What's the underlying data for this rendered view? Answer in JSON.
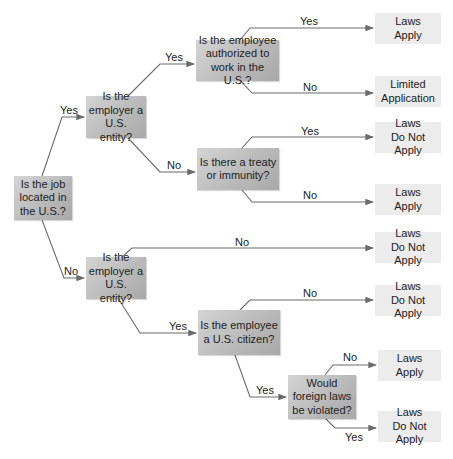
{
  "diagram": {
    "questions": {
      "q_job_location": "Is the job located in the U.S.?",
      "q_employer_top": "Is the employer a U.S. entity?",
      "q_authorized": "Is the employee authorized to work in the U.S.?",
      "q_treaty": "Is there a treaty or immunity?",
      "q_employer_bottom": "Is the employer a U.S. entity?",
      "q_citizen": "Is the employee a U.S. citizen?",
      "q_foreign_laws": "Would foreign laws be violated?"
    },
    "outcomes": {
      "o1": "Laws Apply",
      "o2": "Limited Application",
      "o3": "Laws Do Not Apply",
      "o4": "Laws Apply",
      "o5": "Laws Do Not Apply",
      "o6": "Laws Do Not Apply",
      "o7": "Laws Apply",
      "o8": "Laws Do Not Apply"
    },
    "edges": {
      "e_job_yes": "Yes",
      "e_job_no": "No",
      "e_emp_top_yes": "Yes",
      "e_emp_top_no": "No",
      "e_auth_yes": "Yes",
      "e_auth_no": "No",
      "e_treaty_yes": "Yes",
      "e_treaty_no": "No",
      "e_emp_bottom_no": "No",
      "e_emp_bottom_yes": "Yes",
      "e_citizen_no": "No",
      "e_citizen_yes": "Yes",
      "e_foreign_no": "No",
      "e_foreign_yes": "Yes"
    },
    "colors": {
      "line": "#6b6b6b",
      "question_box": "#bdbdbd",
      "outcome_box": "#ececec"
    }
  }
}
